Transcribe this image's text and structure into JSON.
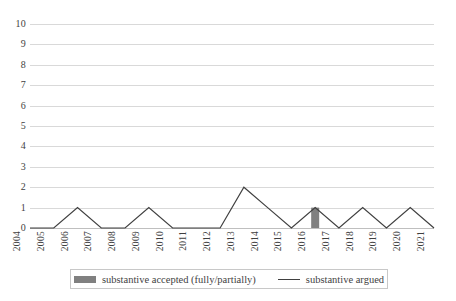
{
  "chart_data": {
    "type": "line",
    "title": "",
    "xlabel": "",
    "ylabel": "",
    "categories": [
      "2004",
      "2005",
      "2006",
      "2007",
      "2008",
      "2009",
      "2010",
      "2011",
      "2012",
      "2013",
      "2014",
      "2015",
      "2016",
      "2017",
      "2018",
      "2019",
      "2020",
      "2021"
    ],
    "ylim": [
      0,
      10
    ],
    "y_ticks": [
      "0",
      "1",
      "2",
      "3",
      "4",
      "5",
      "6",
      "7",
      "8",
      "9",
      "10"
    ],
    "grid": true,
    "legend_position": "bottom",
    "series": [
      {
        "name": "substantive accepted (fully/partially)",
        "type": "bar",
        "color": "#808080",
        "values": [
          0,
          0,
          0,
          0,
          0,
          0,
          0,
          0,
          0,
          0,
          0,
          0,
          1,
          0,
          0,
          0,
          0,
          0
        ]
      },
      {
        "name": "substantive argued",
        "type": "line",
        "color": "#404040",
        "values": [
          0,
          0,
          1,
          0,
          0,
          1,
          0,
          0,
          0,
          2,
          1,
          0,
          1,
          0,
          1,
          0,
          1,
          0
        ]
      }
    ]
  },
  "legend": {
    "entries": [
      {
        "label": "substantive accepted (fully/partially)",
        "marker": "bar-swatch"
      },
      {
        "label": "substantive argued",
        "marker": "line-swatch"
      }
    ]
  }
}
